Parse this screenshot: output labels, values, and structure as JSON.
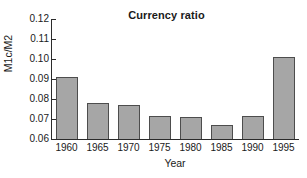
{
  "chart_data": {
    "type": "bar",
    "title": "Currency ratio",
    "xlabel": "Year",
    "ylabel": "M1c/M2",
    "categories": [
      "1960",
      "1965",
      "1970",
      "1975",
      "1980",
      "1985",
      "1990",
      "1995"
    ],
    "values": [
      0.091,
      0.078,
      0.077,
      0.0715,
      0.071,
      0.067,
      0.0715,
      0.101
    ],
    "ylim": [
      0.06,
      0.12
    ],
    "yticks": [
      "0.06",
      "0.07",
      "0.08",
      "0.09",
      "0.10",
      "0.11",
      "0.12"
    ],
    "ytick_values": [
      0.06,
      0.07,
      0.08,
      0.09,
      0.1,
      0.11,
      0.12
    ],
    "grid": false,
    "legend": null,
    "bar_color": "#a6a6a6",
    "bar_edge_color": "#4d4d4d",
    "axis_color": "#2b2b2b",
    "background": "#ffffff"
  }
}
